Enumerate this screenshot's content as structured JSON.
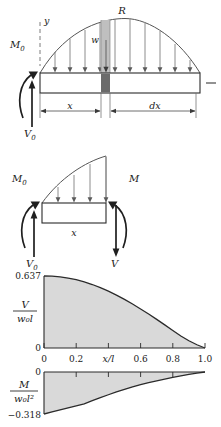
{
  "figure": {
    "title_hidden": "Cantilever beam with sinusoidal distributed load — shear and moment diagrams",
    "ink_color": "#2b2b2b",
    "fill_color": "#d9d9d9",
    "element_fill": "#8c8c8c",
    "guide_color": "#9a9a9a"
  },
  "panel_beam": {
    "label_R": "R",
    "label_w": "w",
    "label_y": "y",
    "label_M0": "M",
    "label_M0_sub": "0",
    "label_V0": "V",
    "label_V0_sub": "0",
    "label_x": "x",
    "label_dx": "dx"
  },
  "panel_fbd": {
    "label_M0": "M",
    "label_M0_sub": "0",
    "label_V0": "V",
    "label_V0_sub": "0",
    "label_M": "M",
    "label_V": "V",
    "label_x": "x"
  },
  "chart_data": [
    {
      "type": "area",
      "name": "shear-diagram",
      "title": "",
      "ylabel_num": "V",
      "ylabel_den": "w₀l",
      "xlabel": "x/l",
      "ytick_labels": [
        "0.637",
        "0"
      ],
      "ytick_values": [
        0.637,
        0
      ],
      "ylim": [
        0,
        0.637
      ],
      "xlim": [
        0,
        1.0
      ],
      "xtick_labels": [
        "0",
        "0.2",
        "0.6",
        "0.8",
        "1.0"
      ],
      "xtick_values": [
        0,
        0.2,
        0.6,
        0.8,
        1.0
      ],
      "grid": false,
      "x": [
        0.0,
        0.05,
        0.1,
        0.15,
        0.2,
        0.25,
        0.3,
        0.35,
        0.4,
        0.45,
        0.5,
        0.55,
        0.6,
        0.65,
        0.7,
        0.75,
        0.8,
        0.85,
        0.9,
        0.95,
        1.0
      ],
      "values": [
        0.637,
        0.6355,
        0.6291,
        0.6188,
        0.6044,
        0.5851,
        0.5617,
        0.5345,
        0.5033,
        0.4684,
        0.4303,
        0.3893,
        0.3457,
        0.3002,
        0.253,
        0.2045,
        0.1554,
        0.1063,
        0.064,
        0.0286,
        0.0
      ]
    },
    {
      "type": "area",
      "name": "moment-diagram",
      "title": "",
      "ylabel_num": "M",
      "ylabel_den": "w₀l²",
      "xlabel": "",
      "ytick_labels": [
        "0",
        "−0.318"
      ],
      "ytick_values": [
        0,
        -0.318
      ],
      "ylim": [
        -0.318,
        0
      ],
      "xlim": [
        0,
        1.0
      ],
      "xtick_labels": [],
      "xtick_values": [
        0,
        0.2,
        0.6,
        0.8,
        1.0
      ],
      "grid": false,
      "x": [
        0.0,
        0.05,
        0.1,
        0.15,
        0.2,
        0.25,
        0.3,
        0.35,
        0.4,
        0.45,
        0.5,
        0.55,
        0.6,
        0.65,
        0.7,
        0.75,
        0.8,
        0.85,
        0.9,
        0.95,
        1.0
      ],
      "values": [
        -0.318,
        -0.302,
        -0.2864,
        -0.271,
        -0.256,
        -0.2414,
        -0.2175,
        -0.1944,
        -0.1723,
        -0.1513,
        -0.1316,
        -0.1132,
        -0.0962,
        -0.0806,
        -0.0664,
        -0.0535,
        -0.041,
        -0.0295,
        -0.0185,
        -0.0085,
        0.0
      ]
    }
  ]
}
